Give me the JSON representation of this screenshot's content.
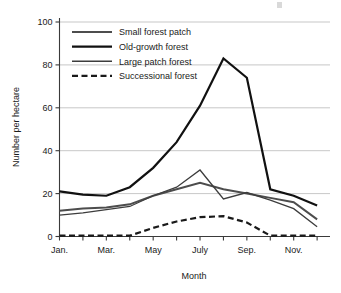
{
  "chart_data": {
    "type": "line",
    "title": "",
    "xlabel": "Month",
    "ylabel": "Number per hectare",
    "ylim": [
      0,
      100
    ],
    "yticks": [
      0,
      20,
      40,
      60,
      80,
      100
    ],
    "ytick_labels": [
      "0",
      "20",
      "40",
      "60",
      "80",
      "100"
    ],
    "grid": true,
    "legend_position": "top-left",
    "categories": [
      "Jan.",
      "Feb.",
      "Mar.",
      "Apr.",
      "May",
      "June",
      "July",
      "Aug.",
      "Sep.",
      "Oct.",
      "Nov.",
      "Dec."
    ],
    "xtick_labels": [
      "Jan.",
      "Mar.",
      "May",
      "July",
      "Sep.",
      "Nov."
    ],
    "xtick_indices": [
      0,
      2,
      4,
      6,
      8,
      10
    ],
    "series": [
      {
        "name": "Small forest patch",
        "color": "#4d4d4d",
        "style": "solid",
        "width": 2.0,
        "values": [
          12,
          13,
          13.5,
          15,
          19,
          22,
          25,
          22,
          20,
          18,
          16,
          8
        ]
      },
      {
        "name": "Old-growth forest",
        "color": "#111111",
        "style": "solid",
        "width": 2.2,
        "values": [
          21,
          19.5,
          19,
          23,
          32,
          44,
          61,
          83,
          74,
          22,
          19,
          14.5
        ]
      },
      {
        "name": "Large patch forest",
        "color": "#3d3d3d",
        "style": "solid",
        "width": 1.3,
        "values": [
          10,
          11,
          12.5,
          14,
          19,
          23,
          31,
          17.5,
          20.5,
          17,
          13,
          4.5
        ]
      },
      {
        "name": "Successional forest",
        "color": "#1a1a1a",
        "style": "dashed",
        "width": 2.2,
        "values": [
          0.4,
          0.4,
          0.4,
          0.4,
          4,
          7,
          9,
          9.5,
          6.5,
          0.4,
          0.4,
          0.4
        ]
      }
    ]
  },
  "axes": {
    "y_title": "Number per hectare",
    "x_title": "Month"
  }
}
